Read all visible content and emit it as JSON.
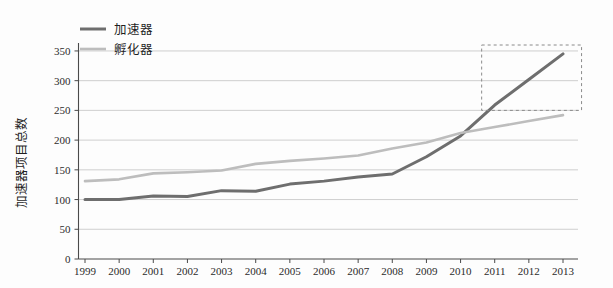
{
  "chart_data": {
    "type": "line",
    "title": "",
    "xlabel": "",
    "ylabel": "加速器项目总数",
    "categories": [
      "1999",
      "2000",
      "2001",
      "2002",
      "2003",
      "2004",
      "2005",
      "2006",
      "2007",
      "2008",
      "2009",
      "2010",
      "2011",
      "2012",
      "2013"
    ],
    "x": [
      1999,
      2000,
      2001,
      2002,
      2003,
      2004,
      2005,
      2006,
      2007,
      2008,
      2009,
      2010,
      2011,
      2012,
      2013
    ],
    "xlim": [
      1999,
      2013
    ],
    "ylim": [
      0,
      360
    ],
    "yticks": [
      0,
      50,
      100,
      150,
      200,
      250,
      300,
      350
    ],
    "ytick_labels": [
      "0",
      "50",
      "100",
      "150",
      "200",
      "250",
      "300",
      "350"
    ],
    "grid": "horizontal",
    "legend_position": "top-left",
    "series": [
      {
        "name": "加速器",
        "color": "#6e6e6e",
        "values": [
          100,
          100,
          106,
          105,
          115,
          114,
          126,
          131,
          138,
          143,
          172,
          207,
          259,
          302,
          345
        ]
      },
      {
        "name": "孵化器",
        "color": "#bdbdbd",
        "values": [
          131,
          134,
          144,
          146,
          149,
          160,
          165,
          169,
          174,
          186,
          196,
          212,
          222,
          232,
          242
        ]
      }
    ],
    "annotations": [
      {
        "name": "highlight-box",
        "type": "dashed-rectangle",
        "x_range": [
          2010.3,
          2013.1
        ],
        "y_range": [
          250,
          360
        ]
      }
    ]
  },
  "legend": {
    "items": [
      {
        "label": "加速器",
        "color": "#6e6e6e"
      },
      {
        "label": "孵化器",
        "color": "#bdbdbd"
      }
    ]
  },
  "axes": {
    "y_title": "加速器项目总数"
  }
}
